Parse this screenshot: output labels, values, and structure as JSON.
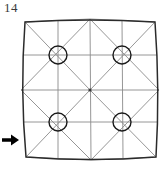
{
  "figure": {
    "label": "14",
    "caption_number": "14",
    "arrow_icon": "right-arrow-icon",
    "arrow_direction": "right",
    "colors": {
      "outline": "#2b2b2b",
      "mesh": "#8a8a8a",
      "circle": "#1a1a1a",
      "arrow": "#000000",
      "label_text": "#3a3a3a",
      "background": "#ffffff"
    },
    "geometry": {
      "outer_corners": [
        {
          "x": 25,
          "y": 22
        },
        {
          "x": 155,
          "y": 22
        },
        {
          "x": 156,
          "y": 157
        },
        {
          "x": 26,
          "y": 157
        }
      ],
      "edge_midpoints": [
        {
          "x": 90,
          "y": 19
        },
        {
          "x": 159,
          "y": 90
        },
        {
          "x": 91,
          "y": 160
        },
        {
          "x": 21,
          "y": 90
        }
      ],
      "center": {
        "x": 90,
        "y": 90
      },
      "circle_radius": 9,
      "circle_centers": [
        {
          "x": 58,
          "y": 55
        },
        {
          "x": 122,
          "y": 55
        },
        {
          "x": 58,
          "y": 122
        },
        {
          "x": 122,
          "y": 122
        }
      ]
    }
  }
}
